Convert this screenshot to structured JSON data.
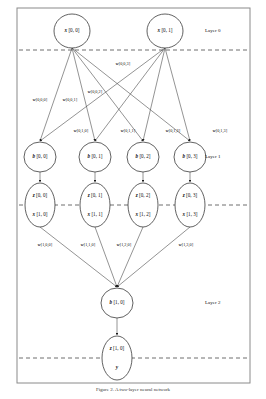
{
  "figure": {
    "frame": {
      "x": 17,
      "y": 8,
      "w": 233,
      "h": 375
    },
    "caption": "Figure 2.  A two-layer neural network"
  },
  "layer_labels": [
    {
      "id": "layer-0",
      "text": "Layer 0",
      "x": 205,
      "y": 31
    },
    {
      "id": "layer-1",
      "text": "Layer 1",
      "x": 205,
      "y": 157
    },
    {
      "id": "layer-2",
      "text": "Layer 2",
      "x": 205,
      "y": 303
    }
  ],
  "dashed_lines": [
    {
      "id": "boundary-0-1",
      "y": 50
    },
    {
      "id": "boundary-1-2",
      "y": 205
    },
    {
      "id": "boundary-output",
      "y": 358
    }
  ],
  "input_nodes": [
    {
      "id": "x-0-0",
      "var": "x",
      "idx": "[0, 0]",
      "cx": 72,
      "cy": 31,
      "rx": 18,
      "ry": 17
    },
    {
      "id": "x-0-1",
      "var": "x",
      "idx": "[0, 1]",
      "cx": 165,
      "cy": 31,
      "rx": 18,
      "ry": 17
    }
  ],
  "bias_nodes": [
    {
      "id": "b-0-0",
      "var": "b",
      "idx": "[0, 0]",
      "cx": 40,
      "cy": 157,
      "rx": 16,
      "ry": 15
    },
    {
      "id": "b-0-1",
      "var": "b",
      "idx": "[0, 1]",
      "cx": 95,
      "cy": 157,
      "rx": 16,
      "ry": 15
    },
    {
      "id": "b-0-2",
      "var": "b",
      "idx": "[0, 2]",
      "cx": 143,
      "cy": 157,
      "rx": 16,
      "ry": 15
    },
    {
      "id": "b-0-3",
      "var": "b",
      "idx": "[0, 3]",
      "cx": 190,
      "cy": 157,
      "rx": 16,
      "ry": 15
    }
  ],
  "hidden_nodes": [
    {
      "id": "zx-0-0",
      "top_var": "z",
      "top_idx": "[0, 0]",
      "bot_var": "x",
      "bot_idx": "[1, 0]",
      "cx": 40,
      "cy": 205,
      "rx": 15,
      "ry": 22
    },
    {
      "id": "zx-0-1",
      "top_var": "z",
      "top_idx": "[0, 1]",
      "bot_var": "x",
      "bot_idx": "[1, 1]",
      "cx": 95,
      "cy": 205,
      "rx": 15,
      "ry": 22
    },
    {
      "id": "zx-0-2",
      "top_var": "z",
      "top_idx": "[0, 2]",
      "bot_var": "x",
      "bot_idx": "[1, 2]",
      "cx": 143,
      "cy": 205,
      "rx": 15,
      "ry": 22
    },
    {
      "id": "zx-0-3",
      "top_var": "z",
      "top_idx": "[0, 3]",
      "bot_var": "x",
      "bot_idx": "[1, 3]",
      "cx": 190,
      "cy": 205,
      "rx": 15,
      "ry": 22
    }
  ],
  "output_bias_node": {
    "id": "b-1-0",
    "var": "b",
    "idx": "[1, 0]",
    "cx": 117,
    "cy": 303,
    "rx": 16,
    "ry": 15
  },
  "output_node": {
    "id": "zy-1-0",
    "top_var": "z",
    "top_idx": "[1, 0]",
    "bot_var": "y",
    "bot_idx": "",
    "cx": 117,
    "cy": 358,
    "rx": 15,
    "ry": 22
  },
  "weights_layer0": [
    {
      "id": "w-0-0-0",
      "var": "w",
      "idx": "[0,0,0]",
      "x": 40,
      "y": 100
    },
    {
      "id": "w-0-0-1",
      "var": "w",
      "idx": "[0,0,1]",
      "x": 70,
      "y": 100
    },
    {
      "id": "w-0-0-2",
      "var": "w",
      "idx": "[0,0,2]",
      "x": 95,
      "y": 92
    },
    {
      "id": "w-0-0-3",
      "var": "w",
      "idx": "[0,0,3]",
      "x": 123,
      "y": 64
    },
    {
      "id": "w-0-1-0",
      "var": "w",
      "idx": "[0,1,0]",
      "x": 81,
      "y": 131
    },
    {
      "id": "w-0-1-1",
      "var": "w",
      "idx": "[0,1,1]",
      "x": 128,
      "y": 131
    },
    {
      "id": "w-0-1-2",
      "var": "w",
      "idx": "[0,1,2]",
      "x": 173,
      "y": 131
    },
    {
      "id": "w-0-1-3",
      "var": "w",
      "idx": "[0,1,3]",
      "x": 220,
      "y": 131
    }
  ],
  "weights_layer1": [
    {
      "id": "w-1-0-0",
      "var": "w",
      "idx": "[1,0,0]",
      "x": 45,
      "y": 245
    },
    {
      "id": "w-1-1-0",
      "var": "w",
      "idx": "[1,1,0]",
      "x": 88,
      "y": 245
    },
    {
      "id": "w-1-2-0",
      "var": "w",
      "idx": "[1,2,0]",
      "x": 124,
      "y": 245
    },
    {
      "id": "w-1-3-0",
      "var": "w",
      "idx": "[1,3,0]",
      "x": 186,
      "y": 245
    }
  ],
  "colors": {
    "ink": "#1a1a1a",
    "frame": "#8a8a8a",
    "node_stroke": "#3a3a3a",
    "edge": "#3a3a3a",
    "dash": "#4a4a4a",
    "background": "#ffffff"
  }
}
